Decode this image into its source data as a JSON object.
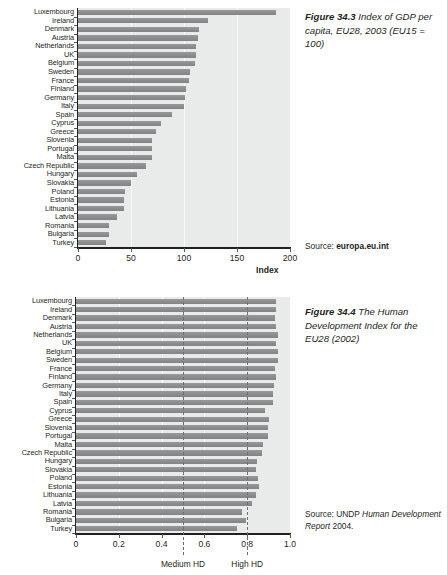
{
  "page": {
    "width": 447,
    "height": 575,
    "background": "#ffffff",
    "bar_color": "#8d8f91",
    "plot_background": "#e9eaea",
    "text_color": "#231f20"
  },
  "figures": [
    {
      "id": "gdp",
      "caption_number": "Figure 34.3",
      "caption_text": "Index of GDP per capita, EU28, 2003 (EU15 = 100)",
      "source_prefix": "Source:",
      "source_strong": "europa.eu.int",
      "source_em": "",
      "source_suffix": ""
    },
    {
      "id": "hdi",
      "caption_number": "Figure 34.4",
      "caption_text": "The Human Development Index for the EU28 (2002)",
      "source_prefix": "Source: UNDP",
      "source_strong": "",
      "source_em": "Human Development Report",
      "source_suffix": "2004."
    }
  ],
  "chart_data": [
    {
      "type": "bar",
      "orientation": "horizontal",
      "title": "Figure 34.3 Index of GDP per capita, EU28, 2003 (EU15 = 100)",
      "xlabel": "Index",
      "ylabel": "",
      "xlim": [
        0,
        200
      ],
      "xticks": [
        0,
        50,
        100,
        150,
        200
      ],
      "xticklabels": [
        "0",
        "50",
        "100",
        "150",
        "200"
      ],
      "grid": true,
      "legend": "none",
      "source": "Source: europa.eu.int",
      "categories": [
        "Luxembourg",
        "Ireland",
        "Denmark",
        "Austria",
        "Netherlands",
        "UK",
        "Belgium",
        "Sweden",
        "France",
        "Finland",
        "Germany",
        "Italy",
        "Spain",
        "Cyprus",
        "Greece",
        "Slovenia",
        "Portugal",
        "Malta",
        "Czech Republic",
        "Hungary",
        "Slovakia",
        "Poland",
        "Estonia",
        "Lithuania",
        "Latvia",
        "Romania",
        "Bulgaria",
        "Turkey"
      ],
      "values": [
        187,
        123,
        114,
        113,
        111,
        111,
        110,
        106,
        105,
        102,
        101,
        100,
        89,
        78,
        74,
        70,
        70,
        70,
        64,
        56,
        50,
        44,
        43,
        43,
        37,
        29,
        29,
        26
      ]
    },
    {
      "type": "bar",
      "orientation": "horizontal",
      "title": "Figure 34.4 The Human Development Index for the EU28 (2002)",
      "xlabel": "",
      "ylabel": "",
      "xlim": [
        0,
        1.0
      ],
      "xticks": [
        0,
        0.2,
        0.4,
        0.6,
        0.8,
        1.0
      ],
      "xticklabels": [
        "0",
        "0.2",
        "0.4",
        "0.6",
        "0.8",
        "1.0"
      ],
      "grid": true,
      "legend": "none",
      "source": "Source: UNDP Human Development Report 2004.",
      "annotations": [
        {
          "label": "Medium HD",
          "x": 0.5
        },
        {
          "label": "High HD",
          "x": 0.8
        }
      ],
      "categories": [
        "Luxembourg",
        "Ireland",
        "Denmark",
        "Austria",
        "Netherlands",
        "UK",
        "Belgium",
        "Sweden",
        "France",
        "Finland",
        "Germany",
        "Italy",
        "Spain",
        "Cyprus",
        "Greece",
        "Slovenia",
        "Portugal",
        "Malta",
        "Czech Republic",
        "Hungary",
        "Slovakia",
        "Poland",
        "Estonia",
        "Lithuania",
        "Latvia",
        "Romania",
        "Bulgaria",
        "Turkey"
      ],
      "values": [
        0.933,
        0.936,
        0.932,
        0.934,
        0.942,
        0.936,
        0.942,
        0.946,
        0.932,
        0.935,
        0.925,
        0.92,
        0.922,
        0.883,
        0.902,
        0.895,
        0.897,
        0.875,
        0.868,
        0.848,
        0.842,
        0.85,
        0.853,
        0.842,
        0.823,
        0.778,
        0.796,
        0.751
      ]
    }
  ]
}
